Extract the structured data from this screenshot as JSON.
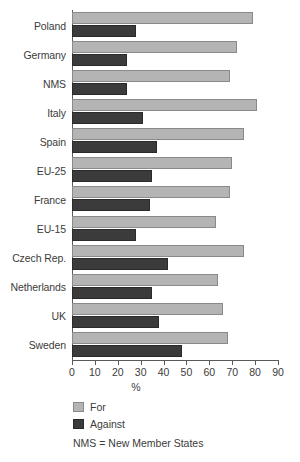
{
  "chart_data": {
    "type": "bar",
    "orientation": "horizontal",
    "title": "",
    "xlabel": "%",
    "ylabel": "",
    "xlim": [
      0,
      90
    ],
    "xticks": [
      0,
      10,
      20,
      30,
      40,
      50,
      60,
      70,
      80,
      90
    ],
    "grid": false,
    "legend_position": "bottom-left",
    "categories": [
      "Poland",
      "Germany",
      "NMS",
      "Italy",
      "Spain",
      "EU-25",
      "France",
      "EU-15",
      "Czech Rep.",
      "Netherlands",
      "UK",
      "Sweden"
    ],
    "series": [
      {
        "name": "For",
        "color": "#b4b4b4",
        "values": [
          79,
          72,
          69,
          81,
          75,
          70,
          69,
          63,
          75,
          64,
          66,
          68
        ]
      },
      {
        "name": "Against",
        "color": "#3b3b3b",
        "values": [
          28,
          24,
          24,
          31,
          37,
          35,
          34,
          28,
          42,
          35,
          38,
          48
        ]
      }
    ],
    "annotations": [
      "NMS = New Member States"
    ]
  },
  "legend": {
    "items": [
      {
        "label": "For",
        "swatch": "light-gray-swatch"
      },
      {
        "label": "Against",
        "swatch": "dark-gray-swatch"
      }
    ]
  },
  "footnote": "NMS = New Member States"
}
